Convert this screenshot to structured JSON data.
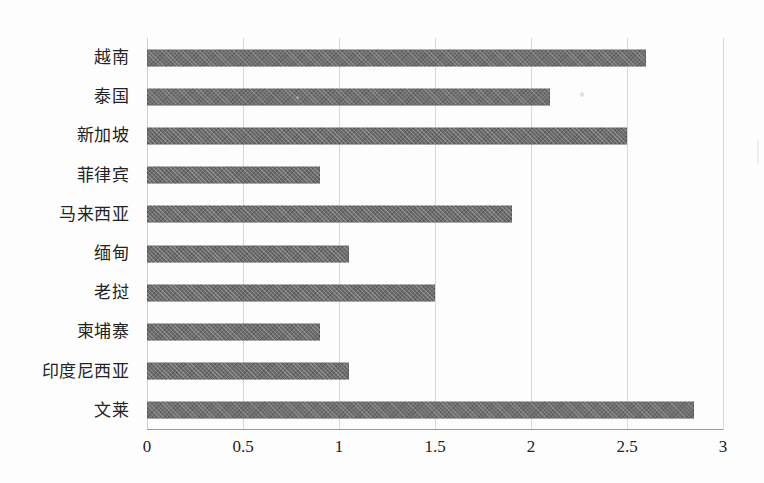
{
  "chart_data": {
    "type": "bar",
    "orientation": "horizontal",
    "title": "",
    "subtitle": "",
    "xlabel": "",
    "ylabel": "",
    "categories": [
      "越南",
      "泰国",
      "新加坡",
      "菲律宾",
      "马来西亚",
      "缅甸",
      "老挝",
      "柬埔寨",
      "印度尼西亚",
      "文莱"
    ],
    "values": [
      2.6,
      2.1,
      2.5,
      0.9,
      1.9,
      1.05,
      1.5,
      0.9,
      1.05,
      2.85
    ],
    "xlim": [
      0,
      3
    ],
    "xticks": [
      0,
      0.5,
      1,
      1.5,
      2,
      2.5,
      3
    ],
    "xtick_labels": [
      "0",
      "0.5",
      "1",
      "1.5",
      "2",
      "2.5",
      "3"
    ],
    "grid": "vertical",
    "legend": "none",
    "bar_color": "#6e6e6e",
    "gridline_color": "#d8d8d8",
    "axis_color": "#9a9a9a",
    "background_color": "#fdfdfd"
  }
}
